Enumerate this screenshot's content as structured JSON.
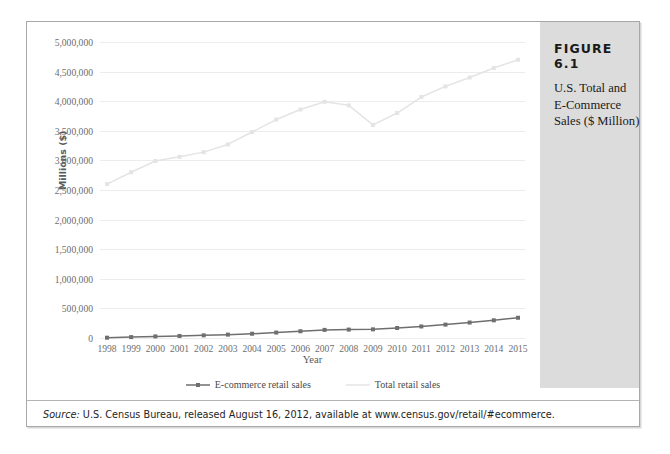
{
  "top_bleed_text": "",
  "figure": {
    "number_label": "FIGURE 6.1",
    "caption": "U.S. Total and E-Commerce Sales ($ Million)"
  },
  "source": {
    "label": "Source:",
    "text": " U.S. Census Bureau, released August 16, 2012, available at www.census.gov/retail/#ecommerce."
  },
  "colors": {
    "ecommerce_line": "#6f6f6f",
    "total_line": "#e4e4e4",
    "gridline": "#ececec",
    "caption_panel": "#dcdcdc",
    "box_border": "#a8a8a8",
    "tick_text": "#6e6e6e"
  },
  "chart_data": {
    "type": "line",
    "title": "",
    "xlabel": "Year",
    "ylabel": "Millions ($)",
    "ylim": [
      0,
      5000000
    ],
    "ytick_values": [
      0,
      500000,
      1000000,
      1500000,
      2000000,
      2500000,
      3000000,
      3500000,
      4000000,
      4500000,
      5000000
    ],
    "ytick_labels": [
      "0",
      "500,000",
      "1,000,000",
      "1,500,000",
      "2,000,000",
      "2,500,000",
      "3,000,000",
      "3,500,000",
      "4,000,000",
      "4,500,000",
      "5,000,000"
    ],
    "categories": [
      1998,
      1999,
      2000,
      2001,
      2002,
      2003,
      2004,
      2005,
      2006,
      2007,
      2008,
      2009,
      2010,
      2011,
      2012,
      2013,
      2014,
      2015
    ],
    "xtick_labels": [
      "1998",
      "1999",
      "2000",
      "2001",
      "2002",
      "2003",
      "2004",
      "2005",
      "2006",
      "2007",
      "2008",
      "2009",
      "2010",
      "2011",
      "2012",
      "2013",
      "2014",
      "2015"
    ],
    "grid": true,
    "legend_position": "bottom",
    "series": [
      {
        "name": "E-commerce retail sales",
        "color": "#6f6f6f",
        "markers": true,
        "values": [
          5000,
          15000,
          27000,
          34000,
          45000,
          57000,
          72000,
          92000,
          114000,
          137000,
          142000,
          146000,
          169000,
          195000,
          226000,
          261000,
          299000,
          342000
        ]
      },
      {
        "name": "Total retail sales",
        "color": "#e4e4e4",
        "markers": true,
        "values": [
          2600000,
          2800000,
          2990000,
          3060000,
          3140000,
          3270000,
          3480000,
          3690000,
          3860000,
          3990000,
          3930000,
          3600000,
          3800000,
          4070000,
          4250000,
          4400000,
          4560000,
          4700000
        ]
      }
    ]
  },
  "legend": {
    "items": [
      {
        "label": "E-commerce retail sales",
        "style": "line-marker"
      },
      {
        "label": "Total retail sales",
        "style": "line"
      }
    ]
  }
}
